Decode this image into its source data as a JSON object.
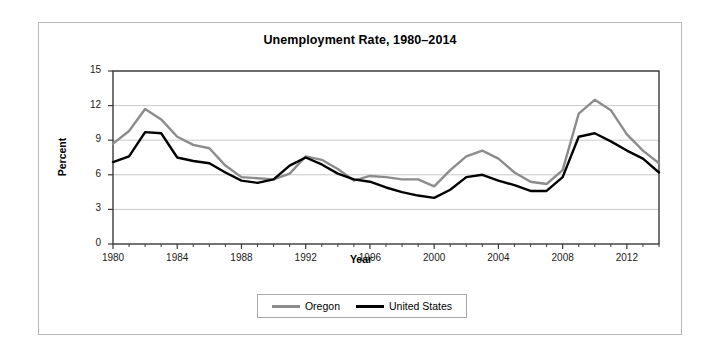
{
  "chart_data": {
    "type": "line",
    "title": "Unemployment Rate, 1980–2014",
    "xlabel": "Year",
    "ylabel": "Percent",
    "xlim": [
      1980,
      2014
    ],
    "ylim": [
      0,
      15
    ],
    "ytick_labels": [
      "0",
      "3",
      "6",
      "9",
      "12",
      "15"
    ],
    "ytick_values": [
      0,
      3,
      6,
      9,
      12,
      15
    ],
    "xtick_labels": [
      "1980",
      "1984",
      "1988",
      "1992",
      "1996",
      "2000",
      "2004",
      "2008",
      "2012"
    ],
    "xtick_values": [
      1980,
      1984,
      1988,
      1992,
      1996,
      2000,
      2004,
      2008,
      2012
    ],
    "minor_xticks": "every year",
    "grid": "horizontal",
    "legend_position": "below-plot",
    "x": [
      1980,
      1981,
      1982,
      1983,
      1984,
      1985,
      1986,
      1987,
      1988,
      1989,
      1990,
      1991,
      1992,
      1993,
      1994,
      1995,
      1996,
      1997,
      1998,
      1999,
      2000,
      2001,
      2002,
      2003,
      2004,
      2005,
      2006,
      2007,
      2008,
      2009,
      2010,
      2011,
      2012,
      2013,
      2014
    ],
    "series": [
      {
        "name": "Oregon",
        "color": "#8c8c8c",
        "values": [
          8.7,
          9.8,
          11.7,
          10.8,
          9.3,
          8.6,
          8.3,
          6.8,
          5.8,
          5.7,
          5.6,
          6.1,
          7.6,
          7.3,
          6.5,
          5.5,
          5.9,
          5.8,
          5.6,
          5.6,
          5.0,
          6.4,
          7.6,
          8.1,
          7.4,
          6.2,
          5.4,
          5.2,
          6.4,
          11.3,
          12.5,
          11.6,
          9.5,
          8.1,
          7.0
        ]
      },
      {
        "name": "United States",
        "color": "#000000",
        "values": [
          7.1,
          7.6,
          9.7,
          9.6,
          7.5,
          7.2,
          7.0,
          6.2,
          5.5,
          5.3,
          5.6,
          6.8,
          7.5,
          6.9,
          6.1,
          5.6,
          5.4,
          4.9,
          4.5,
          4.2,
          4.0,
          4.7,
          5.8,
          6.0,
          5.5,
          5.1,
          4.6,
          4.6,
          5.8,
          9.3,
          9.6,
          8.9,
          8.1,
          7.4,
          6.2
        ]
      }
    ]
  },
  "legend": {
    "items": [
      {
        "label": "Oregon"
      },
      {
        "label": "United States"
      }
    ]
  }
}
